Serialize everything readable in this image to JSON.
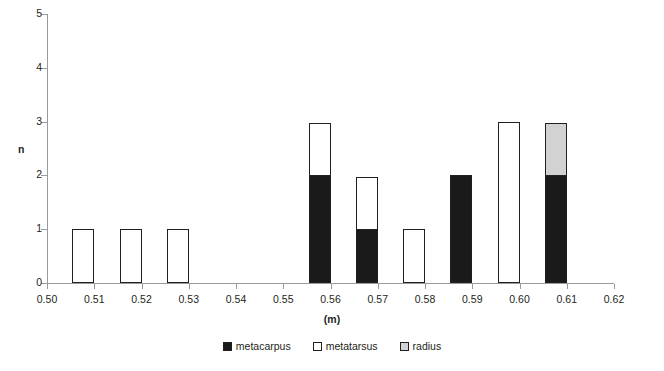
{
  "chart_data": {
    "type": "bar",
    "stacked": true,
    "title": "",
    "xlabel": "(m)",
    "ylabel": "n",
    "xlim": [
      0.5,
      0.62
    ],
    "ylim": [
      0,
      5
    ],
    "xticks": [
      "0.50",
      "0.51",
      "0.52",
      "0.53",
      "0.54",
      "0.55",
      "0.56",
      "0.57",
      "0.58",
      "0.59",
      "0.60",
      "0.61",
      "0.62"
    ],
    "yticks": [
      "0",
      "1",
      "2",
      "3",
      "4",
      "5"
    ],
    "grid": false,
    "legend_position": "bottom",
    "categories": [
      "0.51",
      "0.52",
      "0.53",
      "0.56",
      "0.57",
      "0.58",
      "0.59",
      "0.60",
      "0.61"
    ],
    "series": [
      {
        "name": "metacarpus",
        "color": "#1a1a1a",
        "values": [
          0,
          0,
          0,
          2,
          1,
          0,
          2,
          0,
          2
        ]
      },
      {
        "name": "metatarsus",
        "color": "#ffffff",
        "values": [
          1,
          1,
          1,
          1,
          1,
          1,
          0,
          3,
          0
        ]
      },
      {
        "name": "radius",
        "color": "#d2d2d2",
        "values": [
          0,
          0,
          0,
          0,
          0,
          0,
          0,
          0,
          1
        ]
      }
    ],
    "totals": [
      1,
      1,
      1,
      3,
      2,
      1,
      2,
      3,
      3
    ]
  },
  "legend": {
    "items": [
      {
        "label": "metacarpus"
      },
      {
        "label": "metatarsus"
      },
      {
        "label": "radius"
      }
    ]
  }
}
